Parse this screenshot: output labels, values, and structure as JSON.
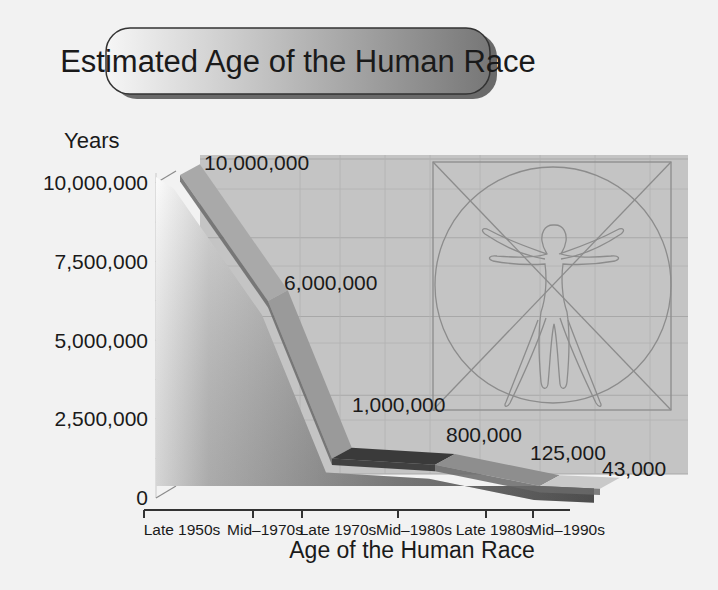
{
  "chart_data": {
    "type": "area",
    "style": "3d-ribbon",
    "title": "Estimated Age of the Human Race",
    "xlabel": "Age of the Human Race",
    "ylabel": "Years",
    "categories": [
      "Late 1950s",
      "Mid–1970s",
      "Late 1970s",
      "Mid–1980s",
      "Late 1980s",
      "Mid–1990s"
    ],
    "values": [
      10000000,
      6000000,
      1000000,
      800000,
      125000,
      43000
    ],
    "data_labels": [
      "10,000,000",
      "6,000,000",
      "1,000,000",
      "800,000",
      "125,000",
      "43,000"
    ],
    "yticks": [
      0,
      2500000,
      5000000,
      7500000,
      10000000
    ],
    "ytick_labels": [
      "0",
      "2,500,000",
      "5,000,000",
      "7,500,000",
      "10,000,000"
    ],
    "ylim": [
      0,
      10000000
    ],
    "grid": true,
    "legend": "none",
    "background_illustration": "vitruvian-man"
  },
  "colors": {
    "page_bg": "#f2f2f2",
    "wall": "#c4c4c4",
    "grid": "#a6a6a6",
    "text": "#1a1a1a",
    "title_gradient_light": "#f4f4f4",
    "title_gradient_dark": "#7a7a7a"
  }
}
